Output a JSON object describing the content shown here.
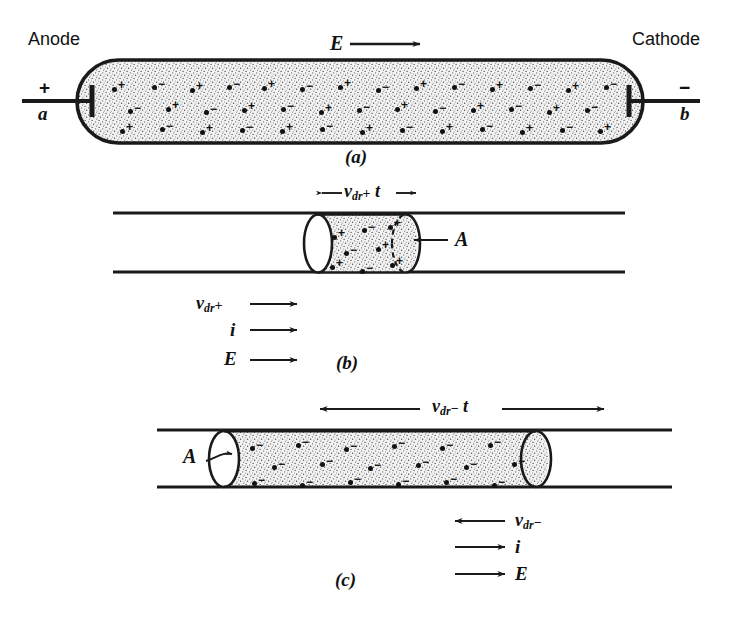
{
  "figure": {
    "ink_color": "#1a1a1a",
    "fill_color": "#e8e8e8"
  },
  "panel_a": {
    "letter": "(a)",
    "anode_label": "Anode",
    "anode_sign": "+",
    "anode_terminal": "a",
    "cathode_label": "Cathode",
    "cathode_sign": "−",
    "cathode_terminal": "b",
    "field_label": "E",
    "field_arrow": "right",
    "carriers": [
      {
        "x": 112,
        "y": 84,
        "sign": "+"
      },
      {
        "x": 152,
        "y": 82,
        "sign": "−"
      },
      {
        "x": 190,
        "y": 85,
        "sign": "+"
      },
      {
        "x": 227,
        "y": 82,
        "sign": "−"
      },
      {
        "x": 262,
        "y": 83,
        "sign": "+"
      },
      {
        "x": 300,
        "y": 84,
        "sign": "−"
      },
      {
        "x": 338,
        "y": 82,
        "sign": "+"
      },
      {
        "x": 376,
        "y": 85,
        "sign": "−"
      },
      {
        "x": 414,
        "y": 83,
        "sign": "+"
      },
      {
        "x": 452,
        "y": 82,
        "sign": "−"
      },
      {
        "x": 490,
        "y": 84,
        "sign": "+"
      },
      {
        "x": 528,
        "y": 83,
        "sign": "−"
      },
      {
        "x": 566,
        "y": 85,
        "sign": "+"
      },
      {
        "x": 604,
        "y": 82,
        "sign": "−"
      },
      {
        "x": 128,
        "y": 106,
        "sign": "−"
      },
      {
        "x": 166,
        "y": 104,
        "sign": "+"
      },
      {
        "x": 204,
        "y": 107,
        "sign": "−"
      },
      {
        "x": 242,
        "y": 105,
        "sign": "+"
      },
      {
        "x": 281,
        "y": 104,
        "sign": "−"
      },
      {
        "x": 319,
        "y": 107,
        "sign": "+"
      },
      {
        "x": 357,
        "y": 105,
        "sign": "−"
      },
      {
        "x": 395,
        "y": 104,
        "sign": "+"
      },
      {
        "x": 433,
        "y": 106,
        "sign": "−"
      },
      {
        "x": 471,
        "y": 105,
        "sign": "+"
      },
      {
        "x": 509,
        "y": 104,
        "sign": "−"
      },
      {
        "x": 547,
        "y": 107,
        "sign": "+"
      },
      {
        "x": 585,
        "y": 105,
        "sign": "−"
      },
      {
        "x": 120,
        "y": 126,
        "sign": "+"
      },
      {
        "x": 160,
        "y": 124,
        "sign": "−"
      },
      {
        "x": 200,
        "y": 127,
        "sign": "+"
      },
      {
        "x": 240,
        "y": 125,
        "sign": "−"
      },
      {
        "x": 280,
        "y": 126,
        "sign": "+"
      },
      {
        "x": 320,
        "y": 124,
        "sign": "−"
      },
      {
        "x": 360,
        "y": 127,
        "sign": "+"
      },
      {
        "x": 400,
        "y": 125,
        "sign": "−"
      },
      {
        "x": 440,
        "y": 126,
        "sign": "+"
      },
      {
        "x": 480,
        "y": 124,
        "sign": "−"
      },
      {
        "x": 520,
        "y": 127,
        "sign": "+"
      },
      {
        "x": 560,
        "y": 125,
        "sign": "−"
      },
      {
        "x": 598,
        "y": 126,
        "sign": "+"
      }
    ]
  },
  "panel_b": {
    "letter": "(b)",
    "length_label": {
      "symbol": "v",
      "subscript": "dr",
      "operator": "+",
      "trailing": "t"
    },
    "length_arrow": "both",
    "area_label": "A",
    "area_arrow": "left",
    "vectors": [
      {
        "symbol": "v",
        "subscript": "dr",
        "operator": "+",
        "direction": "right"
      },
      {
        "symbol": "i",
        "subscript": "",
        "operator": "",
        "direction": "right"
      },
      {
        "symbol": "E",
        "subscript": "",
        "operator": "",
        "direction": "right"
      }
    ],
    "carriers": [
      {
        "x": 332,
        "y": 232,
        "sign": "+"
      },
      {
        "x": 362,
        "y": 225,
        "sign": "−"
      },
      {
        "x": 388,
        "y": 222,
        "sign": "+"
      },
      {
        "x": 344,
        "y": 248,
        "sign": "−"
      },
      {
        "x": 376,
        "y": 244,
        "sign": "+"
      },
      {
        "x": 330,
        "y": 262,
        "sign": "+"
      },
      {
        "x": 360,
        "y": 266,
        "sign": "−"
      },
      {
        "x": 390,
        "y": 260,
        "sign": "+"
      }
    ]
  },
  "panel_c": {
    "letter": "(c)",
    "length_label": {
      "symbol": "v",
      "subscript": "dr",
      "operator": "−",
      "trailing": "t"
    },
    "length_arrow": "both",
    "area_label": "A",
    "area_arrow": "right",
    "vectors": [
      {
        "symbol": "v",
        "subscript": "dr",
        "operator": "−",
        "direction": "left"
      },
      {
        "symbol": "i",
        "subscript": "",
        "operator": "",
        "direction": "right"
      },
      {
        "symbol": "E",
        "subscript": "",
        "operator": "",
        "direction": "right"
      }
    ],
    "carriers": [
      {
        "x": 250,
        "y": 443,
        "sign": "−"
      },
      {
        "x": 296,
        "y": 440,
        "sign": "−"
      },
      {
        "x": 344,
        "y": 444,
        "sign": "−"
      },
      {
        "x": 392,
        "y": 441,
        "sign": "−"
      },
      {
        "x": 440,
        "y": 443,
        "sign": "−"
      },
      {
        "x": 488,
        "y": 440,
        "sign": "−"
      },
      {
        "x": 272,
        "y": 462,
        "sign": "−"
      },
      {
        "x": 320,
        "y": 459,
        "sign": "−"
      },
      {
        "x": 368,
        "y": 463,
        "sign": "−"
      },
      {
        "x": 416,
        "y": 460,
        "sign": "−"
      },
      {
        "x": 464,
        "y": 462,
        "sign": "−"
      },
      {
        "x": 512,
        "y": 459,
        "sign": "−"
      },
      {
        "x": 252,
        "y": 478,
        "sign": "−"
      },
      {
        "x": 300,
        "y": 480,
        "sign": "−"
      },
      {
        "x": 348,
        "y": 477,
        "sign": "−"
      },
      {
        "x": 396,
        "y": 479,
        "sign": "−"
      },
      {
        "x": 444,
        "y": 477,
        "sign": "−"
      },
      {
        "x": 492,
        "y": 480,
        "sign": "−"
      }
    ]
  }
}
